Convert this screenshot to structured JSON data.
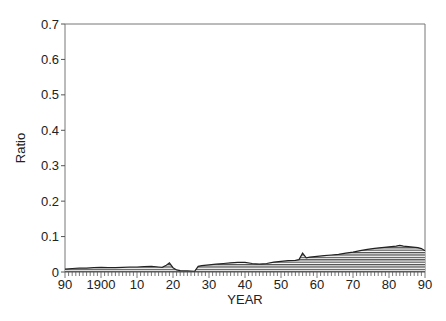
{
  "chart_data": {
    "type": "area",
    "title": "",
    "xlabel": "YEAR",
    "ylabel": "Ratio",
    "xlim": [
      1890,
      1990
    ],
    "ylim": [
      0,
      0.7
    ],
    "grid": false,
    "legend": null,
    "fill_pattern": "horizontal-hatch",
    "x_ticks": [
      1890,
      1900,
      1910,
      1920,
      1930,
      1940,
      1950,
      1960,
      1970,
      1980,
      1990
    ],
    "x_tick_labels": [
      "90",
      "1900",
      "10",
      "20",
      "30",
      "40",
      "50",
      "60",
      "70",
      "80",
      "90"
    ],
    "y_ticks": [
      0,
      0.1,
      0.2,
      0.3,
      0.4,
      0.5,
      0.6,
      0.7
    ],
    "y_tick_labels": [
      "0",
      "0.1",
      "0.2",
      "0.3",
      "0.4",
      "0.5",
      "0.6",
      "0.7"
    ],
    "series": [
      {
        "name": "Ratio",
        "x": [
          1890,
          1892,
          1894,
          1896,
          1898,
          1900,
          1902,
          1904,
          1906,
          1908,
          1910,
          1912,
          1914,
          1916,
          1917,
          1918,
          1919,
          1920,
          1921,
          1922,
          1924,
          1926,
          1927,
          1928,
          1930,
          1932,
          1934,
          1936,
          1938,
          1940,
          1942,
          1944,
          1946,
          1948,
          1950,
          1952,
          1954,
          1955,
          1956,
          1957,
          1958,
          1960,
          1962,
          1964,
          1966,
          1968,
          1970,
          1972,
          1974,
          1976,
          1978,
          1980,
          1982,
          1983,
          1984,
          1986,
          1988,
          1989,
          1990
        ],
        "values": [
          0.008,
          0.01,
          0.011,
          0.011,
          0.012,
          0.013,
          0.012,
          0.012,
          0.013,
          0.014,
          0.014,
          0.015,
          0.016,
          0.014,
          0.013,
          0.018,
          0.026,
          0.012,
          0.006,
          0.004,
          0.003,
          0.002,
          0.016,
          0.018,
          0.02,
          0.022,
          0.024,
          0.026,
          0.027,
          0.027,
          0.024,
          0.022,
          0.024,
          0.028,
          0.03,
          0.032,
          0.033,
          0.035,
          0.053,
          0.04,
          0.042,
          0.044,
          0.046,
          0.048,
          0.05,
          0.053,
          0.056,
          0.06,
          0.064,
          0.067,
          0.069,
          0.071,
          0.073,
          0.075,
          0.073,
          0.071,
          0.069,
          0.066,
          0.06
        ]
      }
    ]
  }
}
